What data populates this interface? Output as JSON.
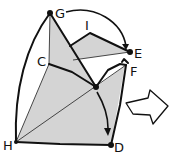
{
  "diagram": {
    "type": "origami-fold-step",
    "colors": {
      "paper_fill": "#d4d4d4",
      "line": "#111111",
      "background": "#ffffff"
    },
    "points": {
      "G": {
        "label": "G",
        "x": 50,
        "y": 13
      },
      "I": {
        "label": "I",
        "x": 90,
        "y": 33
      },
      "E": {
        "label": "E",
        "x": 130,
        "y": 52
      },
      "F": {
        "label": "F",
        "x": 126,
        "y": 65
      },
      "C": {
        "label": "C",
        "x": 49,
        "y": 64
      },
      "H": {
        "label": "H",
        "x": 16,
        "y": 142
      },
      "D": {
        "label": "D",
        "x": 111,
        "y": 145
      },
      "center": {
        "label": "",
        "x": 96,
        "y": 87
      }
    },
    "arrows": [
      {
        "name": "fold-G-to-E",
        "from": "G",
        "to": "E"
      },
      {
        "name": "fold-center-to-D",
        "from": "center",
        "to": "D"
      }
    ],
    "next_step_arrow": {
      "direction": "right",
      "style": "hollow"
    }
  }
}
